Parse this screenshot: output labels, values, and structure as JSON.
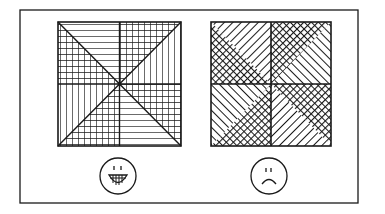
{
  "figure": {
    "left_panel": {
      "pattern": "pinwheel of grid and line hatch triangles",
      "face": "smiling-face",
      "face_meaning": "good"
    },
    "right_panel": {
      "pattern": "quadrants split diagonally with crosshatch and diagonal line triangles",
      "face": "frowning-face",
      "face_meaning": "bad"
    },
    "colors": {
      "ink": "#1a1a1a",
      "paper": "#ffffff"
    }
  }
}
